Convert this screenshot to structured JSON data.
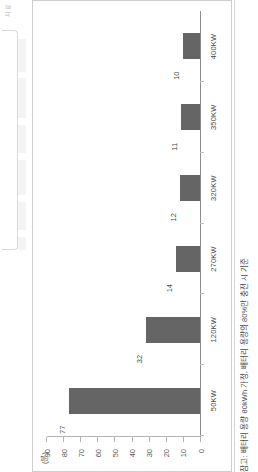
{
  "figure": {
    "unit_label": "(분)",
    "source_tag": "자료",
    "footnote": "참고: 배터리 용량 80kWh 가정, 배터리 용량의 80%만 충전 시 기준"
  },
  "colors": {
    "bar": "#656565",
    "axis": "#8c8c8c",
    "panel_border": "#cfcfcf",
    "text": "#4a4a4a"
  },
  "chart_data": {
    "type": "bar",
    "title": "",
    "xlabel": "",
    "ylabel": "(분)",
    "ylim": [
      0,
      90
    ],
    "grid": false,
    "legend": null,
    "categories": [
      "50KW",
      "120KW",
      "270KW",
      "320KW",
      "350KW",
      "400KW"
    ],
    "values": [
      77,
      32,
      14,
      12,
      11,
      10
    ],
    "value_labels": [
      "77",
      "32",
      "14",
      "12",
      "11",
      "10"
    ],
    "yticks": [
      0,
      10,
      20,
      30,
      40,
      50,
      60,
      70,
      80,
      90
    ],
    "ytick_labels": [
      "0",
      "10",
      "20",
      "30",
      "40",
      "50",
      "60",
      "70",
      "80",
      "90"
    ]
  }
}
